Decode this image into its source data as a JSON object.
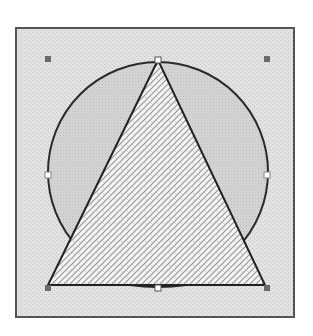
{
  "diagram": {
    "frame": {
      "x": 15,
      "y": 27,
      "width": 280,
      "height": 291,
      "fill": "#e2e2e2",
      "stroke": "#555555"
    },
    "circle": {
      "cx": 158,
      "cy": 172,
      "r": 110,
      "fill": "#d4d4d4",
      "stroke": "#2a2a2a"
    },
    "triangle": {
      "points": "158,60 48,285 265,285",
      "fill": "#f2f2f2",
      "stroke": "#222222"
    },
    "colors": {
      "hatch_line": "#9a9a9a",
      "dot_pattern": "#c4c4c4",
      "handle_fill": "#6a6a6a",
      "handle_hollow": "#ffffff"
    },
    "corner_handles": [
      {
        "name": "handle-top-left",
        "x": 48,
        "y": 59
      },
      {
        "name": "handle-top-right",
        "x": 267,
        "y": 59
      },
      {
        "name": "handle-bottom-left",
        "x": 48,
        "y": 288
      },
      {
        "name": "handle-bottom-right",
        "x": 267,
        "y": 288
      }
    ],
    "edge_handles": [
      {
        "name": "handle-top",
        "x": 158,
        "y": 60
      },
      {
        "name": "handle-left",
        "x": 48,
        "y": 175
      },
      {
        "name": "handle-right",
        "x": 267,
        "y": 175
      },
      {
        "name": "handle-bottom",
        "x": 158,
        "y": 288
      }
    ]
  }
}
